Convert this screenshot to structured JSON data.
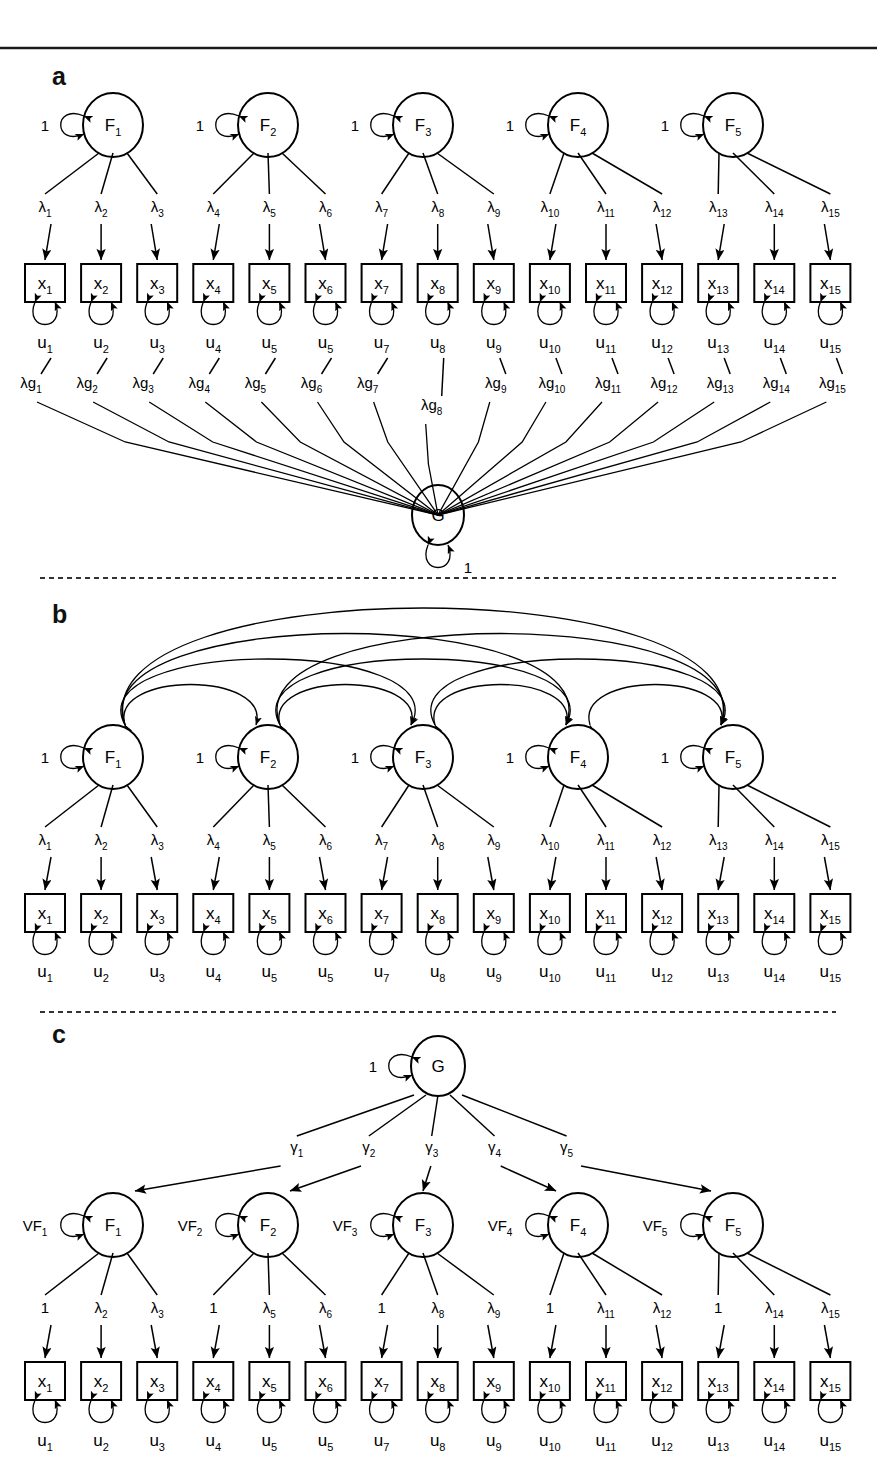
{
  "figure": {
    "type": "sem-path-diagram",
    "panels": [
      "a",
      "b",
      "c"
    ],
    "separators": {
      "top_rule": "solid",
      "a_b": "dashed",
      "b_c": "dashed"
    }
  },
  "labels": {
    "panel_a": "a",
    "panel_b": "b",
    "panel_c": "c",
    "one": "1",
    "G": "G"
  },
  "indicators": {
    "x": [
      "x",
      "x",
      "x",
      "x",
      "x",
      "x",
      "x",
      "x",
      "x",
      "x",
      "x",
      "x",
      "x",
      "x",
      "x"
    ],
    "x_subs": [
      "1",
      "2",
      "3",
      "4",
      "5",
      "6",
      "7",
      "8",
      "9",
      "10",
      "11",
      "12",
      "13",
      "14",
      "15"
    ],
    "u": [
      "u",
      "u",
      "u",
      "u",
      "u",
      "u",
      "u",
      "u",
      "u",
      "u",
      "u",
      "u",
      "u",
      "u",
      "u"
    ],
    "u_subs": [
      "1",
      "2",
      "3",
      "4",
      "5",
      "5",
      "7",
      "8",
      "9",
      "10",
      "11",
      "12",
      "13",
      "14",
      "15"
    ]
  },
  "factors": {
    "name": "F",
    "subs": [
      "1",
      "2",
      "3",
      "4",
      "5"
    ],
    "variance_label": "1",
    "variance_label_c": "VF",
    "variance_subs_c": [
      "1",
      "2",
      "3",
      "4",
      "5"
    ]
  },
  "panel_a": {
    "loading_symbol": "λ",
    "loading_subs": [
      "1",
      "2",
      "3",
      "4",
      "5",
      "6",
      "7",
      "8",
      "9",
      "10",
      "11",
      "12",
      "13",
      "14",
      "15"
    ],
    "g_loading_symbol": "λg",
    "g_loading_subs": [
      "1",
      "2",
      "3",
      "4",
      "5",
      "6",
      "7",
      "8",
      "9",
      "10",
      "11",
      "12",
      "13",
      "14",
      "15"
    ],
    "general_factor": "G",
    "general_variance": "1"
  },
  "panel_b": {
    "loading_symbol": "λ",
    "loading_subs": [
      "1",
      "2",
      "3",
      "4",
      "5",
      "6",
      "7",
      "8",
      "9",
      "10",
      "11",
      "12",
      "13",
      "14",
      "15"
    ],
    "factor_variance": "1",
    "correlation_pairs": [
      [
        1,
        2
      ],
      [
        2,
        3
      ],
      [
        3,
        4
      ],
      [
        4,
        5
      ],
      [
        1,
        3
      ],
      [
        2,
        4
      ],
      [
        3,
        5
      ],
      [
        1,
        4
      ],
      [
        2,
        5
      ],
      [
        1,
        5
      ]
    ]
  },
  "panel_c": {
    "general_factor": "G",
    "general_variance": "1",
    "gamma_symbol": "γ",
    "gamma_subs": [
      "1",
      "2",
      "3",
      "4",
      "5"
    ],
    "loading_labels": [
      "1",
      "λ",
      "λ",
      "1",
      "λ",
      "λ",
      "1",
      "λ",
      "λ",
      "1",
      "λ",
      "λ",
      "1",
      "λ",
      "λ"
    ],
    "loading_subs": [
      "",
      "2",
      "3",
      "",
      "5",
      "6",
      "",
      "8",
      "9",
      "",
      "11",
      "12",
      "",
      "14",
      "15"
    ],
    "factor_variance_symbol": "VF"
  },
  "colors": {
    "ink": "#000000",
    "paper": "#ffffff",
    "rule": "#1a1a1a"
  }
}
